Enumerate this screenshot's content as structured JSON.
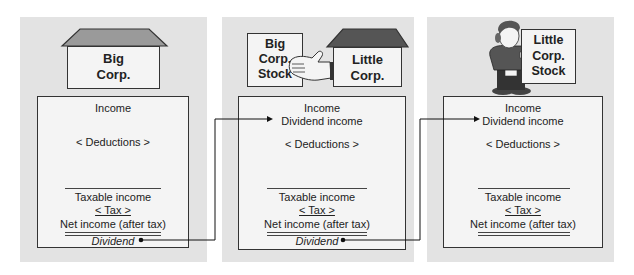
{
  "panels": [
    {
      "name": "big-corp",
      "header": {
        "icon": "house-icon",
        "label_line1": "Big",
        "label_line2": "Corp."
      },
      "ledger": {
        "income": "Income",
        "deductions": "< Deductions >",
        "taxable_income": "Taxable income",
        "tax": "< Tax >",
        "net_income": "Net income (after tax)",
        "dividend": "Dividend"
      }
    },
    {
      "name": "little-corp",
      "header": {
        "stock_label_line1": "Big",
        "stock_label_line2": "Corp.",
        "stock_label_line3": "Stock",
        "hand_icon": "hand-icon",
        "house_icon": "house-icon",
        "label_line1": "Little",
        "label_line2": "Corp."
      },
      "ledger": {
        "income": "Income",
        "dividend_income": "Dividend income",
        "deductions": "< Deductions >",
        "taxable_income": "Taxable income",
        "tax": "< Tax >",
        "net_income": "Net income (after tax)",
        "dividend": "Dividend"
      }
    },
    {
      "name": "shareholder",
      "header": {
        "person_icon": "shareholder-person-icon",
        "stock_label_line1": "Little",
        "stock_label_line2": "Corp.",
        "stock_label_line3": "Stock"
      },
      "ledger": {
        "income": "Income",
        "dividend_income": "Dividend income",
        "deductions": "< Deductions >",
        "taxable_income": "Taxable income",
        "tax": "< Tax >",
        "net_income": "Net income (after tax)"
      }
    }
  ],
  "colors": {
    "panel_bg": "#e3e3e3",
    "box_bg": "#f4f4f4",
    "roof_light": "#9a9a9a",
    "roof_dark": "#555555",
    "border": "#333333"
  }
}
